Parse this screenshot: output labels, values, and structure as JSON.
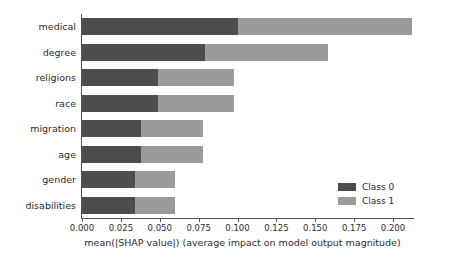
{
  "chart_data": {
    "type": "bar",
    "orientation": "horizontal",
    "stacked": true,
    "title": "",
    "xlabel": "mean(|SHAP value|) (average impact on model output magnitude)",
    "ylabel": "",
    "categories": [
      "medical",
      "degree",
      "religions",
      "race",
      "migration",
      "age",
      "gender",
      "disabilities"
    ],
    "series": [
      {
        "name": "Class 0",
        "color": "#4d4d4d",
        "values": [
          0.1,
          0.079,
          0.049,
          0.049,
          0.038,
          0.038,
          0.034,
          0.034
        ]
      },
      {
        "name": "Class 1",
        "color": "#9b9b9b",
        "values": [
          0.112,
          0.079,
          0.049,
          0.049,
          0.04,
          0.04,
          0.026,
          0.026
        ]
      }
    ],
    "totals": [
      0.212,
      0.158,
      0.098,
      0.098,
      0.078,
      0.078,
      0.06,
      0.06
    ],
    "xlim": [
      0.0,
      0.2135
    ],
    "xticks": [
      0.0,
      0.025,
      0.05,
      0.075,
      0.1,
      0.125,
      0.15,
      0.175,
      0.2
    ],
    "xtick_labels": [
      "0.000",
      "0.025",
      "0.050",
      "0.075",
      "0.100",
      "0.125",
      "0.150",
      "0.175",
      "0.200"
    ],
    "grid": false,
    "legend_position": "lower right",
    "legend_entries": [
      "Class 0",
      "Class 1"
    ]
  },
  "axis": {
    "x_title": "mean(|SHAP value|) (average impact on model output magnitude)"
  },
  "legend": {
    "entries": [
      {
        "label": "Class 0",
        "color": "#4d4d4d"
      },
      {
        "label": "Class 1",
        "color": "#9b9b9b"
      }
    ]
  }
}
